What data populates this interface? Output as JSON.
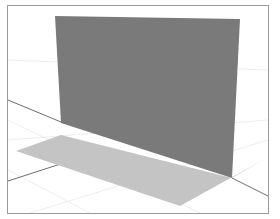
{
  "viewport": {
    "type": "3d-model-view",
    "background": "#ffffff",
    "frame_color": "#9a9a9a"
  },
  "scene": {
    "objects": [
      {
        "name": "vertical-plane",
        "fill": "#7a7a7a",
        "points": "55,16 240,19 232,178 61,123"
      },
      {
        "name": "ground-shadow",
        "fill": "#c4c4c4",
        "points": "16,151 61,135 232,178 263,160 180,206"
      }
    ],
    "axis_lines": [
      {
        "name": "axis-line-left-upper",
        "points": "8,100 61,122"
      },
      {
        "name": "axis-line-left-lower",
        "points": "8,181 79,158"
      },
      {
        "name": "axis-line-right",
        "points": "232,178 268,196"
      }
    ],
    "colors": {
      "wall": "#7a7a7a",
      "shadow": "#c4c4c4",
      "axis": "#6e6e6e",
      "grid": "#ececec"
    }
  }
}
